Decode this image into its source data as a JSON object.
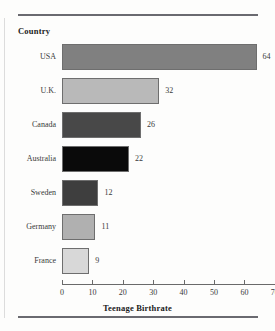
{
  "rules": {
    "top_present": true,
    "bottom_present": true
  },
  "chart_data": {
    "type": "bar",
    "orientation": "horizontal",
    "title": "",
    "xlabel": "Teenage Birthrate",
    "ylabel": "Country",
    "categories": [
      "USA",
      "U.K.",
      "Canada",
      "Australia",
      "Sweden",
      "Germany",
      "France"
    ],
    "values": [
      64,
      32,
      26,
      22,
      12,
      11,
      9
    ],
    "value_labels": [
      "64",
      "32",
      "26",
      "22",
      "12",
      "11",
      "9"
    ],
    "bar_colors": [
      "#808080",
      "#b9b9b9",
      "#484848",
      "#0a0a0a",
      "#3e3e3e",
      "#b0b0b0",
      "#d8d8d8"
    ],
    "bar_border_color": "#6e6e6e",
    "xlim": [
      0,
      70
    ],
    "xticks": [
      0,
      10,
      20,
      30,
      40,
      50,
      60,
      70
    ],
    "xtick_labels": [
      "0",
      "10",
      "20",
      "30",
      "40",
      "50",
      "60",
      "70"
    ],
    "grid": false,
    "legend": "none"
  }
}
